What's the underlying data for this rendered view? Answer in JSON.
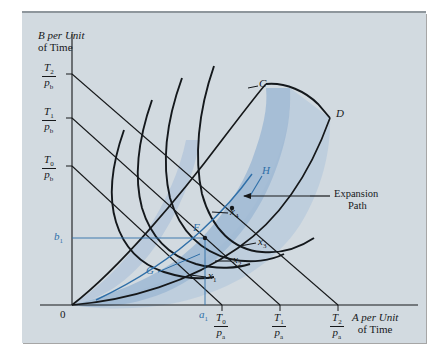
{
  "figure": {
    "kind": "isoquant-expansion-path-diagram",
    "panel_bg": "#d2dae0",
    "shade_light": "#c3d0de",
    "shade_mid": "#aec3da",
    "shade_dark": "#9db7d4",
    "curve_color": "#14181c",
    "accent_blue": "#2f6fa8"
  },
  "axes": {
    "y_title_line1": "B per Unit",
    "y_title_line2": "of Time",
    "x_title_line1": "A per Unit",
    "x_title_line2": "of Time",
    "origin_label": "0",
    "y_ticks": [
      {
        "id": "t2b",
        "num": "T",
        "num_sub": "2",
        "den": "p",
        "den_sub": "b"
      },
      {
        "id": "t1b",
        "num": "T",
        "num_sub": "1",
        "den": "p",
        "den_sub": "b"
      },
      {
        "id": "t0b",
        "num": "T",
        "num_sub": "0",
        "den": "p",
        "den_sub": "b"
      }
    ],
    "x_ticks": [
      {
        "id": "t0a",
        "num": "T",
        "num_sub": "0",
        "den": "p",
        "den_sub": "a"
      },
      {
        "id": "t1a",
        "num": "T",
        "num_sub": "1",
        "den": "p",
        "den_sub": "a"
      },
      {
        "id": "t2a",
        "num": "T",
        "num_sub": "2",
        "den": "p",
        "den_sub": "a"
      }
    ],
    "b1_label": "b",
    "b1_sub": "1",
    "a1_label": "a",
    "a1_sub": "1"
  },
  "isoquants": [
    {
      "id": "x1",
      "label": "x",
      "sub": "1"
    },
    {
      "id": "x2",
      "label": "x",
      "sub": "2"
    },
    {
      "id": "x3",
      "label": "x",
      "sub": "3"
    },
    {
      "id": "x4",
      "label": "x",
      "sub": "4"
    }
  ],
  "points": [
    {
      "id": "C",
      "label": "C",
      "color": "#16181a"
    },
    {
      "id": "D",
      "label": "D",
      "color": "#16181a"
    },
    {
      "id": "F",
      "label": "F",
      "color": "#2f6fa8"
    },
    {
      "id": "G",
      "label": "G",
      "color": "#2f6fa8"
    },
    {
      "id": "H",
      "label": "H",
      "color": "#2f6fa8"
    }
  ],
  "annotations": [
    {
      "id": "expansion-path",
      "line1": "Expansion",
      "line2": "Path"
    }
  ]
}
